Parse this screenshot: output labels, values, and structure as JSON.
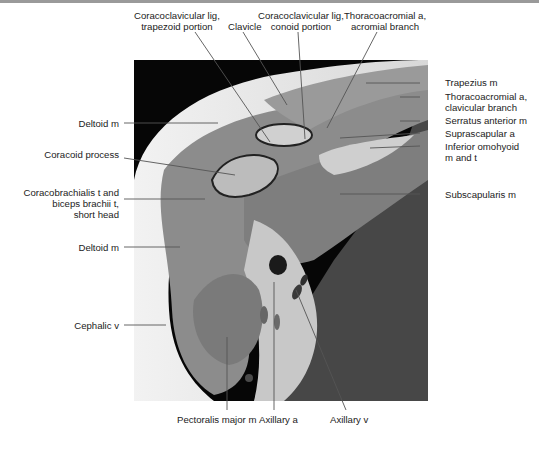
{
  "figure": {
    "rule_color": "#9a9a9a",
    "labels_top": [
      {
        "id": "trapezoid",
        "line1": "Coracoclavicular lig,",
        "line2": "trapezoid portion"
      },
      {
        "id": "clavicle",
        "line1": "Clavicle",
        "line2": ""
      },
      {
        "id": "conoid",
        "line1": "Coracoclavicular lig,",
        "line2": "conoid portion"
      },
      {
        "id": "acromial",
        "line1": "Thoracoacromial a,",
        "line2": "acromial branch"
      }
    ],
    "labels_right": [
      {
        "id": "trapezius",
        "line1": "Trapezius m",
        "line2": ""
      },
      {
        "id": "thoraco_clav",
        "line1": "Thoracoacromial a,",
        "line2": "clavicular branch"
      },
      {
        "id": "serratus",
        "line1": "Serratus anterior m",
        "line2": ""
      },
      {
        "id": "suprascapular",
        "line1": "Suprascapular a",
        "line2": ""
      },
      {
        "id": "omohyoid",
        "line1": "Inferior omohyoid",
        "line2": "m and t"
      },
      {
        "id": "subscapularis",
        "line1": "Subscapularis m",
        "line2": ""
      }
    ],
    "labels_left": [
      {
        "id": "deltoid1",
        "line1": "Deltoid m",
        "line2": "",
        "line3": ""
      },
      {
        "id": "coracoid",
        "line1": "Coracoid process",
        "line2": "",
        "line3": ""
      },
      {
        "id": "coracobrachialis",
        "line1": "Coracobrachialis t and",
        "line2": "biceps brachii t,",
        "line3": "short head"
      },
      {
        "id": "deltoid2",
        "line1": "Deltoid m",
        "line2": "",
        "line3": ""
      },
      {
        "id": "cephalic",
        "line1": "Cephalic v",
        "line2": "",
        "line3": ""
      }
    ],
    "labels_bottom": [
      {
        "id": "pectoralis",
        "line1": "Pectoralis major m"
      },
      {
        "id": "axillary_a",
        "line1": "Axillary a"
      },
      {
        "id": "axillary_v",
        "line1": "Axillary v"
      }
    ]
  }
}
